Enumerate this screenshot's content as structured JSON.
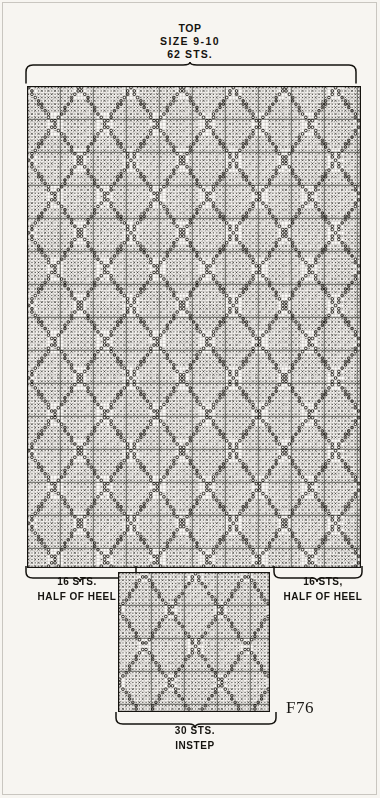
{
  "page": {
    "background": "#f7f5f1",
    "ink": "#15130f",
    "plate_number": "F76"
  },
  "top_caption": {
    "line1": "TOP",
    "line2": "SIZE 9-10",
    "line3": "62 STS."
  },
  "heel_left_caption": {
    "line1": "16 STS.",
    "line2": "HALF OF HEEL"
  },
  "heel_right_caption": {
    "line1": "16 STS,",
    "line2": "HALF OF HEEL"
  },
  "instep_caption": {
    "line1": "30 STS.",
    "line2": "INSTEP"
  },
  "chart_data": {
    "type": "heatmap",
    "title": "TOP SIZE 9-10 62 STS.",
    "xlabel": "stitches",
    "ylabel": "rows",
    "grid": true,
    "legend": "none",
    "symbols": [
      {
        "code": "dot",
        "glyph": "·",
        "meaning": "purl / textured stitch"
      },
      {
        "code": "cross",
        "glyph": "×",
        "meaning": "contrast colour stitch"
      },
      {
        "code": "circle",
        "glyph": "○",
        "meaning": "lattice / overstitch line"
      },
      {
        "code": "blank",
        "glyph": "",
        "meaning": "knit in main colour"
      }
    ],
    "main_panel": {
      "stitches": 62,
      "rows": 145,
      "cell_px": 3.3,
      "heavy_line_every": 10,
      "half_heel_stitches_left": 16,
      "half_heel_stitches_right": 16
    },
    "instep_panel": {
      "stitches": 30,
      "rows": 42,
      "cell_px": 3.3,
      "heavy_line_every": 10
    },
    "axis_annotations": [
      {
        "position": "top",
        "text": "TOP SIZE 9-10 62 STS."
      },
      {
        "position": "bottom-left",
        "text": "16 STS. HALF OF HEEL"
      },
      {
        "position": "bottom-right",
        "text": "16 STS, HALF OF HEEL"
      },
      {
        "position": "bottom",
        "text": "30 STS. INSTEP"
      }
    ]
  }
}
